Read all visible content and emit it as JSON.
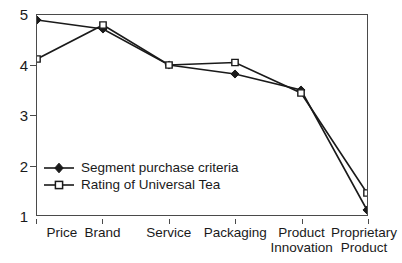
{
  "chart_data": {
    "type": "line",
    "title": "",
    "xlabel": "",
    "ylabel": "",
    "categories": [
      "Price",
      "Brand",
      "Service",
      "Packaging",
      "Product Innovation",
      "Proprietary Product"
    ],
    "category_lines": [
      [
        "Price",
        ""
      ],
      [
        "Brand",
        ""
      ],
      [
        "Service",
        ""
      ],
      [
        "Packaging",
        ""
      ],
      [
        "Product",
        "Innovation"
      ],
      [
        "Proprietary",
        "Product"
      ]
    ],
    "series": [
      {
        "name": "Segment purchase criteria",
        "marker": "filled-diamond",
        "values": [
          4.9,
          4.72,
          4.0,
          3.82,
          3.5,
          1.1
        ]
      },
      {
        "name": "Rating of Universal Tea",
        "marker": "open-square",
        "values": [
          4.12,
          4.8,
          4.0,
          4.05,
          3.44,
          1.44
        ]
      }
    ],
    "ylim": [
      1,
      5
    ],
    "y_ticks": [
      1,
      2,
      3,
      4,
      5
    ],
    "y_tick_labels": [
      "1",
      "2",
      "3",
      "4",
      "5"
    ],
    "grid": false,
    "legend_position": "inside-lower-left",
    "colors": {
      "line": "#1a1a1a",
      "axis": "#4a4a4a",
      "background": "#ffffff",
      "marker_fill": "#1a1a1a",
      "marker_open_fill": "#ffffff"
    }
  },
  "legend": {
    "items": [
      {
        "label": "Segment purchase criteria",
        "marker": "filled-diamond"
      },
      {
        "label": "Rating of Universal Tea",
        "marker": "open-square"
      }
    ]
  }
}
